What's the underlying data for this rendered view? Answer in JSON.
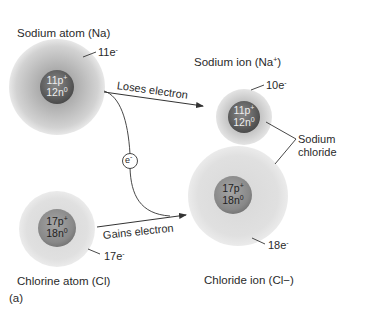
{
  "figure_label": "(a)",
  "colors": {
    "shell_gray": "#c9c9c9",
    "shell_light": "#e6e6e6",
    "nucleus_dark": "#6e6e6e",
    "nucleus_light": "#9a9a9a",
    "line": "#333333"
  },
  "sodium_atom": {
    "title": "Sodium atom (Na)",
    "electrons": "11e",
    "electron_sign": "-",
    "protons": "11p",
    "proton_sign": "+",
    "neutrons": "12n",
    "neutron_sign": "0"
  },
  "sodium_ion": {
    "title": "Sodium ion (Na+)",
    "electrons": "10e",
    "electron_sign": "-",
    "protons": "11p",
    "proton_sign": "+",
    "neutrons": "12n",
    "neutron_sign": "0"
  },
  "chlorine_atom": {
    "title": "Chlorine atom (Cl)",
    "electrons": "17e",
    "electron_sign": "-",
    "protons": "17p",
    "proton_sign": "+",
    "neutrons": "18n",
    "neutron_sign": "0"
  },
  "chloride_ion": {
    "title": "Chloride ion (Cl−)",
    "electrons": "18e",
    "electron_sign": "-",
    "protons": "17p",
    "proton_sign": "+",
    "neutrons": "18n",
    "neutron_sign": "0"
  },
  "arrows": {
    "loses": "Loses electron",
    "gains": "Gains electron",
    "electron_token": "e",
    "electron_token_sign": "-"
  },
  "bracket": {
    "line1": "Sodium",
    "line2": "chloride"
  }
}
